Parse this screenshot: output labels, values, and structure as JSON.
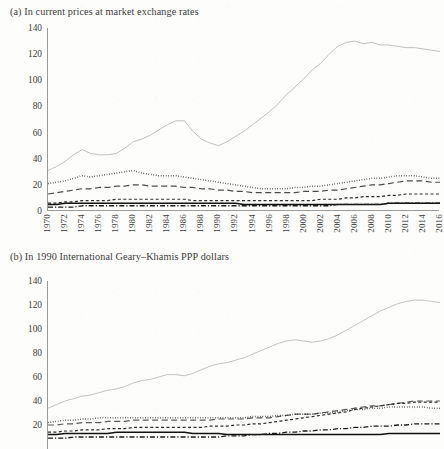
{
  "figure": {
    "panel_a_title": "(a) In current prices at market exchange rates",
    "panel_b_title": "(b) In 1990 International Geary–Khamis PPP dollars"
  },
  "chart_data": [
    {
      "type": "line",
      "panel": "a",
      "title": "(a) In current prices at market exchange rates",
      "xlabel": "",
      "ylabel": "",
      "xlim": [
        1970,
        2016
      ],
      "ylim": [
        0,
        140
      ],
      "yticks": [
        0,
        20,
        40,
        60,
        80,
        100,
        120,
        140
      ],
      "grid": false,
      "legend": "none",
      "x": [
        1970,
        1971,
        1972,
        1973,
        1974,
        1975,
        1976,
        1977,
        1978,
        1979,
        1980,
        1981,
        1982,
        1983,
        1984,
        1985,
        1986,
        1987,
        1988,
        1989,
        1990,
        1991,
        1992,
        1993,
        1994,
        1995,
        1996,
        1997,
        1998,
        1999,
        2000,
        2001,
        2002,
        2003,
        2004,
        2005,
        2006,
        2007,
        2008,
        2009,
        2010,
        2011,
        2012,
        2013,
        2014,
        2015,
        2016
      ],
      "series": [
        {
          "name": "series-1",
          "style": "solid-grey",
          "color": "#b9b9b9",
          "values": [
            31,
            34,
            38,
            43,
            47,
            44,
            43,
            43,
            44,
            48,
            53,
            55,
            58,
            62,
            66,
            69,
            69,
            61,
            55,
            52,
            50,
            53,
            57,
            61,
            66,
            71,
            76,
            82,
            89,
            95,
            101,
            108,
            113,
            120,
            126,
            129,
            130,
            128,
            129,
            127,
            127,
            126,
            125,
            125,
            124,
            123,
            122
          ]
        },
        {
          "name": "series-2",
          "style": "dotted",
          "color": "#1c1c1c",
          "values": [
            21,
            22,
            23,
            25,
            27,
            26,
            27,
            28,
            29,
            30,
            31,
            29,
            28,
            27,
            27,
            27,
            26,
            25,
            24,
            23,
            22,
            21,
            20,
            19,
            18,
            17,
            17,
            17,
            17,
            18,
            18,
            19,
            19,
            20,
            21,
            22,
            23,
            24,
            25,
            25,
            26,
            27,
            27,
            27,
            26,
            25,
            25
          ]
        },
        {
          "name": "series-3",
          "style": "long-dash",
          "color": "#4a4a4a",
          "values": [
            13,
            14,
            15,
            16,
            17,
            17,
            18,
            18,
            19,
            19,
            20,
            20,
            19,
            19,
            19,
            19,
            18,
            18,
            17,
            17,
            16,
            16,
            15,
            15,
            14,
            14,
            14,
            14,
            14,
            14,
            15,
            15,
            15,
            16,
            16,
            17,
            18,
            19,
            20,
            20,
            21,
            22,
            23,
            23,
            23,
            22,
            22
          ]
        },
        {
          "name": "series-4",
          "style": "short-dash",
          "color": "#2a2a2a",
          "values": [
            6,
            6,
            7,
            7,
            8,
            8,
            8,
            8,
            9,
            9,
            9,
            9,
            9,
            9,
            9,
            9,
            9,
            8,
            8,
            8,
            8,
            8,
            8,
            8,
            8,
            8,
            8,
            8,
            8,
            8,
            8,
            8,
            9,
            9,
            9,
            10,
            10,
            11,
            11,
            11,
            12,
            12,
            13,
            13,
            13,
            13,
            13
          ]
        },
        {
          "name": "series-5",
          "style": "solid-black",
          "color": "#111111",
          "values": [
            5,
            5,
            6,
            6,
            6,
            6,
            6,
            6,
            6,
            6,
            6,
            6,
            6,
            6,
            6,
            6,
            6,
            6,
            6,
            6,
            6,
            6,
            6,
            5,
            5,
            5,
            5,
            5,
            5,
            5,
            5,
            5,
            5,
            5,
            5,
            5,
            5,
            5,
            5,
            5,
            6,
            6,
            6,
            6,
            6,
            6,
            6
          ]
        },
        {
          "name": "series-6",
          "style": "dash-dot",
          "color": "#1a1a1a",
          "values": [
            3,
            3,
            3,
            3,
            4,
            4,
            4,
            4,
            4,
            4,
            4,
            4,
            4,
            4,
            4,
            4,
            4,
            4,
            4,
            4,
            4,
            4,
            4,
            4,
            4,
            4,
            4,
            4,
            4,
            4,
            4,
            4,
            4,
            4,
            5,
            5,
            5,
            5,
            5,
            5,
            6,
            6,
            6,
            6,
            6,
            6,
            6
          ]
        }
      ],
      "xticks": [
        1970,
        1972,
        1974,
        1976,
        1978,
        1980,
        1982,
        1984,
        1986,
        1988,
        1990,
        1992,
        1994,
        1996,
        1998,
        2000,
        2002,
        2004,
        2006,
        2008,
        2010,
        2012,
        2014,
        2016
      ]
    },
    {
      "type": "line",
      "panel": "b",
      "title": "(b) In 1990 International Geary–Khamis PPP dollars",
      "xlabel": "",
      "ylabel": "",
      "xlim": [
        1970,
        2016
      ],
      "ylim": [
        0,
        140
      ],
      "yticks": [
        20,
        40,
        60,
        80,
        100,
        120,
        140
      ],
      "grid": false,
      "legend": "none",
      "x": [
        1970,
        1971,
        1972,
        1973,
        1974,
        1975,
        1976,
        1977,
        1978,
        1979,
        1980,
        1981,
        1982,
        1983,
        1984,
        1985,
        1986,
        1987,
        1988,
        1989,
        1990,
        1991,
        1992,
        1993,
        1994,
        1995,
        1996,
        1997,
        1998,
        1999,
        2000,
        2001,
        2002,
        2003,
        2004,
        2005,
        2006,
        2007,
        2008,
        2009,
        2010,
        2011,
        2012,
        2013,
        2014,
        2015,
        2016
      ],
      "series": [
        {
          "name": "series-1",
          "style": "solid-grey",
          "color": "#bcbcbc",
          "values": [
            34,
            37,
            40,
            42,
            44,
            45,
            47,
            49,
            50,
            52,
            55,
            57,
            58,
            60,
            62,
            62,
            61,
            63,
            66,
            69,
            71,
            72,
            74,
            76,
            79,
            82,
            85,
            88,
            90,
            91,
            90,
            89,
            90,
            92,
            95,
            99,
            103,
            107,
            111,
            115,
            118,
            121,
            123,
            124,
            124,
            123,
            122
          ]
        },
        {
          "name": "series-2",
          "style": "long-dash",
          "color": "#5a5a5a",
          "values": [
            20,
            20,
            21,
            21,
            22,
            22,
            22,
            23,
            23,
            23,
            24,
            24,
            24,
            24,
            24,
            24,
            24,
            24,
            24,
            24,
            25,
            25,
            25,
            25,
            26,
            26,
            26,
            27,
            28,
            29,
            29,
            29,
            30,
            31,
            32,
            33,
            34,
            35,
            36,
            36,
            37,
            38,
            39,
            40,
            40,
            40,
            40
          ]
        },
        {
          "name": "series-3",
          "style": "dotted",
          "color": "#1c1c1c",
          "values": [
            22,
            23,
            24,
            24,
            25,
            25,
            26,
            26,
            26,
            26,
            26,
            26,
            26,
            26,
            26,
            26,
            26,
            26,
            26,
            26,
            26,
            26,
            26,
            26,
            27,
            27,
            27,
            28,
            28,
            29,
            29,
            29,
            30,
            30,
            31,
            32,
            33,
            33,
            34,
            34,
            35,
            35,
            35,
            35,
            35,
            34,
            34
          ]
        },
        {
          "name": "series-4",
          "style": "short-dash",
          "color": "#2a2a2a",
          "values": [
            14,
            14,
            15,
            15,
            16,
            16,
            16,
            17,
            17,
            17,
            18,
            18,
            18,
            18,
            18,
            18,
            18,
            18,
            18,
            19,
            19,
            19,
            20,
            20,
            21,
            21,
            22,
            23,
            24,
            25,
            26,
            27,
            28,
            29,
            30,
            31,
            33,
            34,
            35,
            36,
            37,
            38,
            38,
            39,
            39,
            39,
            39
          ]
        },
        {
          "name": "series-5",
          "style": "solid-black",
          "color": "#111111",
          "values": [
            12,
            12,
            13,
            13,
            13,
            13,
            13,
            13,
            14,
            14,
            14,
            14,
            14,
            14,
            14,
            14,
            14,
            13,
            13,
            13,
            13,
            12,
            12,
            12,
            12,
            12,
            12,
            12,
            12,
            12,
            12,
            12,
            12,
            12,
            12,
            12,
            12,
            12,
            12,
            12,
            13,
            13,
            13,
            13,
            13,
            13,
            13
          ]
        },
        {
          "name": "series-6",
          "style": "dash-dot",
          "color": "#1a1a1a",
          "values": [
            9,
            9,
            9,
            10,
            10,
            10,
            10,
            10,
            10,
            10,
            10,
            10,
            10,
            10,
            10,
            10,
            10,
            10,
            10,
            10,
            10,
            11,
            11,
            11,
            12,
            12,
            13,
            13,
            14,
            14,
            15,
            15,
            16,
            16,
            17,
            17,
            18,
            18,
            19,
            19,
            19,
            20,
            20,
            21,
            21,
            21,
            21
          ]
        }
      ],
      "xticks": []
    }
  ]
}
